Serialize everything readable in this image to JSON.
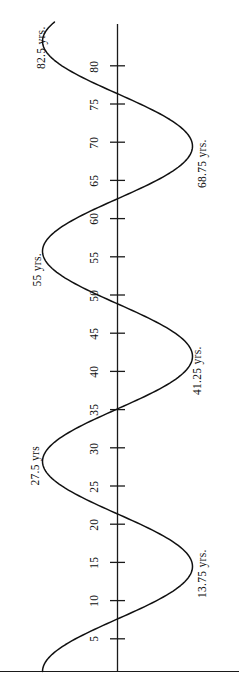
{
  "figure": {
    "title": "",
    "orientation": "vertical-axis-rotated-labels",
    "axis_color": "#1a1a1a",
    "curve_color": "#111111",
    "baseline_color": "#1a1a1a"
  },
  "axis": {
    "name": "age-axis",
    "unit": "yrs.",
    "ticks": [
      {
        "value": 5,
        "label": "5"
      },
      {
        "value": 10,
        "label": "10"
      },
      {
        "value": 15,
        "label": "15"
      },
      {
        "value": 20,
        "label": "20"
      },
      {
        "value": 25,
        "label": "25"
      },
      {
        "value": 30,
        "label": "30"
      },
      {
        "value": 35,
        "label": "35"
      },
      {
        "value": 40,
        "label": "40"
      },
      {
        "value": 45,
        "label": "45"
      },
      {
        "value": 50,
        "label": "50"
      },
      {
        "value": 55,
        "label": "55"
      },
      {
        "value": 60,
        "label": "60"
      },
      {
        "value": 65,
        "label": "65"
      },
      {
        "value": 70,
        "label": "70"
      },
      {
        "value": 75,
        "label": "75"
      },
      {
        "value": 80,
        "label": "80"
      }
    ]
  },
  "extreme_labels": [
    {
      "id": "peak-13-75",
      "text": "13.75 yrs.",
      "value": 13.75,
      "side": "right"
    },
    {
      "id": "peak-27-5",
      "text": "27.5 yrs",
      "value": 27.5,
      "side": "left"
    },
    {
      "id": "peak-41-25",
      "text": "41.25 yrs.",
      "value": 41.25,
      "side": "right"
    },
    {
      "id": "peak-55",
      "text": "55 yrs.",
      "value": 55,
      "side": "left"
    },
    {
      "id": "peak-68-75",
      "text": "68.75 yrs.",
      "value": 68.75,
      "side": "right"
    },
    {
      "id": "peak-82-5",
      "text": "82.5 yrs.",
      "value": 82.5,
      "side": "left"
    }
  ],
  "chart_data": {
    "type": "line",
    "title": "",
    "subtitle": "",
    "xlabel": "",
    "ylabel": "",
    "orientation": "vertical",
    "grid": false,
    "legend": null,
    "axis_variable": "age",
    "axis_unit": "yrs.",
    "ylim": [
      0,
      85
    ],
    "xlim": [
      -1,
      1
    ],
    "tick_values": [
      5,
      10,
      15,
      20,
      25,
      30,
      35,
      40,
      45,
      50,
      55,
      60,
      65,
      70,
      75,
      80
    ],
    "tick_labels": [
      "5",
      "10",
      "15",
      "20",
      "25",
      "30",
      "35",
      "40",
      "45",
      "50",
      "55",
      "60",
      "65",
      "70",
      "75",
      "80"
    ],
    "series": [
      {
        "name": "wave",
        "description": "sinusoidal curve with period 27.5 yrs crossing the axis at 0, 6.875, 20.625, 34.375, 48.125, 61.875, 75",
        "period": 27.5,
        "amplitude": 1,
        "zero_crossings": [
          0,
          6.875,
          20.625,
          34.375,
          48.125,
          61.875,
          75
        ],
        "extremes": [
          {
            "age": 13.75,
            "side": "right",
            "label": "13.75 yrs."
          },
          {
            "age": 27.5,
            "side": "left",
            "label": "27.5 yrs"
          },
          {
            "age": 41.25,
            "side": "right",
            "label": "41.25 yrs."
          },
          {
            "age": 55,
            "side": "left",
            "label": "55 yrs."
          },
          {
            "age": 68.75,
            "side": "right",
            "label": "68.75 yrs."
          },
          {
            "age": 82.5,
            "side": "left",
            "label": "82.5 yrs."
          }
        ],
        "points": [
          {
            "age": 0.0,
            "x": 0.0
          },
          {
            "age": 6.875,
            "x": 0.0
          },
          {
            "age": 13.75,
            "x": 1.0
          },
          {
            "age": 20.625,
            "x": 0.0
          },
          {
            "age": 27.5,
            "x": -1.0
          },
          {
            "age": 34.375,
            "x": 0.0
          },
          {
            "age": 41.25,
            "x": 1.0
          },
          {
            "age": 48.125,
            "x": 0.0
          },
          {
            "age": 55.0,
            "x": -1.0
          },
          {
            "age": 61.875,
            "x": 0.0
          },
          {
            "age": 68.75,
            "x": 1.0
          },
          {
            "age": 75.0,
            "x": 0.0
          },
          {
            "age": 82.5,
            "x": -1.0
          },
          {
            "age": 85.0,
            "x": -0.6
          }
        ]
      }
    ]
  }
}
